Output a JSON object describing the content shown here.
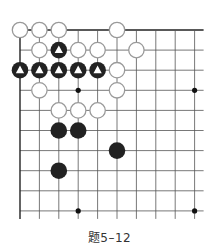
{
  "caption": "题5–12",
  "board": {
    "origin_x": 20,
    "origin_y": 30,
    "col_step": 19.4,
    "row_step": 20.1,
    "cols": 10,
    "rows": 10,
    "extend_right": 9,
    "extend_down": 8,
    "colors": {
      "line": "#555555",
      "edge": "#222222",
      "black_stone": "#222222",
      "white_stone_fill": "#ffffff",
      "white_stone_stroke": "#9a9a9a",
      "marker": "#ffffff",
      "star": "#111111"
    },
    "star_points": [
      {
        "col": 3,
        "row": 3
      },
      {
        "col": 9,
        "row": 3
      },
      {
        "col": 3,
        "row": 9
      },
      {
        "col": 9,
        "row": 9
      }
    ],
    "stones": [
      {
        "color": "white",
        "col": 0,
        "row": 0
      },
      {
        "color": "white",
        "col": 1,
        "row": 0
      },
      {
        "color": "white",
        "col": 2,
        "row": 0
      },
      {
        "color": "white",
        "col": 5,
        "row": 0
      },
      {
        "color": "white",
        "col": 1,
        "row": 1
      },
      {
        "color": "black",
        "col": 2,
        "row": 1,
        "marker": "triangle"
      },
      {
        "color": "white",
        "col": 3,
        "row": 1
      },
      {
        "color": "white",
        "col": 4,
        "row": 1
      },
      {
        "color": "white",
        "col": 6,
        "row": 1
      },
      {
        "color": "black",
        "col": 0,
        "row": 2,
        "marker": "triangle"
      },
      {
        "color": "black",
        "col": 1,
        "row": 2,
        "marker": "triangle"
      },
      {
        "color": "black",
        "col": 2,
        "row": 2,
        "marker": "triangle"
      },
      {
        "color": "black",
        "col": 3,
        "row": 2,
        "marker": "triangle"
      },
      {
        "color": "black",
        "col": 4,
        "row": 2,
        "marker": "triangle"
      },
      {
        "color": "white",
        "col": 5,
        "row": 2
      },
      {
        "color": "white",
        "col": 1,
        "row": 3
      },
      {
        "color": "white",
        "col": 5,
        "row": 3
      },
      {
        "color": "white",
        "col": 2,
        "row": 4
      },
      {
        "color": "white",
        "col": 3,
        "row": 4
      },
      {
        "color": "white",
        "col": 4,
        "row": 4
      },
      {
        "color": "black",
        "col": 2,
        "row": 5
      },
      {
        "color": "black",
        "col": 3,
        "row": 5
      },
      {
        "color": "black",
        "col": 5,
        "row": 6
      },
      {
        "color": "black",
        "col": 2,
        "row": 7
      }
    ]
  }
}
